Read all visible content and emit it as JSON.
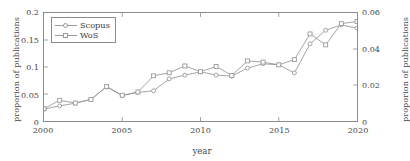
{
  "chart_data": {
    "type": "line",
    "title": "",
    "xlabel": "year",
    "ylabel": "proporion of publications",
    "ylabel_right": "proporion of publications",
    "grid": false,
    "legend_position": "top-left",
    "x": [
      2000,
      2001,
      2002,
      2003,
      2004,
      2005,
      2006,
      2007,
      2008,
      2009,
      2010,
      2011,
      2012,
      2013,
      2014,
      2015,
      2016,
      2017,
      2018,
      2019,
      2020
    ],
    "xlim": [
      2000,
      2020
    ],
    "xticks": [
      2000,
      2005,
      2010,
      2015,
      2020
    ],
    "xticklabels": [
      "2000",
      "2005",
      "2010",
      "2015",
      "2020"
    ],
    "ylim": [
      0,
      0.2
    ],
    "yticks": [
      0,
      0.05,
      0.1,
      0.15,
      0.2
    ],
    "yticklabels": [
      "0",
      "0.05",
      "0.1",
      "0.15",
      "0.2"
    ],
    "ylim_right": [
      0,
      0.06
    ],
    "yticks_right": [
      0,
      0.02,
      0.04,
      0.06
    ],
    "yticklabels_right": [
      "0",
      "0.02",
      "0.04",
      "0.06"
    ],
    "series": [
      {
        "name": "Scopus",
        "axis": "left",
        "color": "#9a9a9a",
        "marker": "circle",
        "values": [
          0.022,
          0.028,
          0.033,
          0.04,
          0.063,
          0.047,
          0.053,
          0.056,
          0.078,
          0.085,
          0.091,
          0.085,
          0.083,
          0.098,
          0.106,
          0.104,
          0.089,
          0.143,
          0.168,
          0.178,
          0.172
        ]
      },
      {
        "name": "WoS",
        "axis": "right",
        "color": "#9a9a9a",
        "marker": "square",
        "values": [
          0.0068,
          0.0115,
          0.01,
          0.012,
          0.0192,
          0.0143,
          0.0161,
          0.0251,
          0.0268,
          0.0306,
          0.0274,
          0.0303,
          0.0253,
          0.0334,
          0.0327,
          0.0312,
          0.0341,
          0.0484,
          0.0423,
          0.0541,
          0.0553
        ]
      }
    ]
  },
  "legend": {
    "items": [
      {
        "label": "Scopus"
      },
      {
        "label": "WoS"
      }
    ]
  }
}
